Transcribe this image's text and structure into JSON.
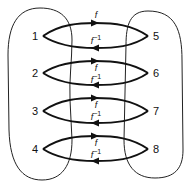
{
  "diagram": {
    "left_set": {
      "nodes": [
        "1",
        "2",
        "3",
        "4"
      ]
    },
    "right_set": {
      "nodes": [
        "5",
        "6",
        "7",
        "8"
      ]
    },
    "mappings": [
      {
        "from": "1",
        "to": "5",
        "forward_label": "f",
        "inverse_label_base": "f",
        "inverse_label_exp": "−1"
      },
      {
        "from": "2",
        "to": "6",
        "forward_label": "f",
        "inverse_label_base": "f",
        "inverse_label_exp": "−1"
      },
      {
        "from": "3",
        "to": "7",
        "forward_label": "f",
        "inverse_label_base": "f",
        "inverse_label_exp": "−1"
      },
      {
        "from": "4",
        "to": "8",
        "forward_label": "f",
        "inverse_label_base": "f",
        "inverse_label_exp": "−1"
      }
    ]
  }
}
